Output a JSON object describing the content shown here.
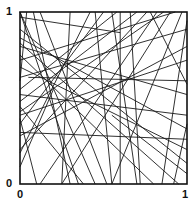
{
  "figure": {
    "type": "random-lines-in-unit-square",
    "labels": {
      "y_top": "1",
      "y_origin": "0",
      "x_origin": "0",
      "x_right": "1"
    },
    "colors": {
      "line": "#1a1a1a",
      "frame": "#111111",
      "background": "#ffffff"
    },
    "lines": [
      [
        0.0,
        1.0,
        0.45,
        0.0
      ],
      [
        0.0,
        1.0,
        0.35,
        0.0
      ],
      [
        0.0,
        0.97,
        0.6,
        0.88
      ],
      [
        0.04,
        1.0,
        0.0,
        0.6
      ],
      [
        0.08,
        1.0,
        0.3,
        0.0
      ],
      [
        0.42,
        1.0,
        0.0,
        0.18
      ],
      [
        0.45,
        1.0,
        0.55,
        0.0
      ],
      [
        0.5,
        1.0,
        0.0,
        0.35
      ],
      [
        0.55,
        1.0,
        0.7,
        0.0
      ],
      [
        0.58,
        1.0,
        0.0,
        0.55
      ],
      [
        0.6,
        1.0,
        0.6,
        0.0
      ],
      [
        0.66,
        1.0,
        0.72,
        0.0
      ],
      [
        0.7,
        1.0,
        0.0,
        0.48
      ],
      [
        0.76,
        1.0,
        0.0,
        0.2
      ],
      [
        0.78,
        1.0,
        1.0,
        0.58
      ],
      [
        0.82,
        1.0,
        0.12,
        0.0
      ],
      [
        0.86,
        1.0,
        0.0,
        0.42
      ],
      [
        0.9,
        1.0,
        0.25,
        0.0
      ],
      [
        0.93,
        1.0,
        0.0,
        0.72
      ],
      [
        0.97,
        1.0,
        0.55,
        0.0
      ],
      [
        1.0,
        0.95,
        0.85,
        0.0
      ],
      [
        1.0,
        0.9,
        0.0,
        0.62
      ],
      [
        1.0,
        0.8,
        0.0,
        0.28
      ],
      [
        1.0,
        0.72,
        0.0,
        0.4
      ],
      [
        1.0,
        0.6,
        0.05,
        0.62
      ],
      [
        1.0,
        0.52,
        0.0,
        0.8
      ],
      [
        1.0,
        0.4,
        0.0,
        0.52
      ],
      [
        1.0,
        0.32,
        0.0,
        0.85
      ],
      [
        1.0,
        0.26,
        0.0,
        0.3
      ],
      [
        1.0,
        0.2,
        0.0,
        0.68
      ],
      [
        1.0,
        0.12,
        0.0,
        0.9
      ],
      [
        1.0,
        0.06,
        0.55,
        0.4
      ],
      [
        0.0,
        0.75,
        0.8,
        0.0
      ],
      [
        0.0,
        0.82,
        0.95,
        0.0
      ],
      [
        0.0,
        0.45,
        0.38,
        0.0
      ],
      [
        0.0,
        0.1,
        0.2,
        0.55
      ],
      [
        0.12,
        1.0,
        0.52,
        0.0
      ],
      [
        0.25,
        0.0,
        0.3,
        1.0
      ],
      [
        0.1,
        0.0,
        0.0,
        0.38
      ],
      [
        0.92,
        0.0,
        1.0,
        0.35
      ]
    ]
  }
}
